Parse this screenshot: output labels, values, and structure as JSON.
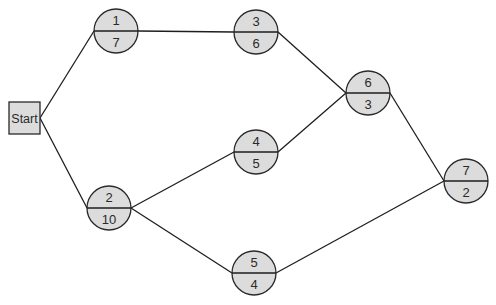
{
  "diagram": {
    "type": "network-diagram",
    "start": {
      "label": "Start",
      "x": 9,
      "y": 102,
      "w": 31,
      "h": 32
    },
    "nodes": [
      {
        "id": "1",
        "top": "1",
        "bottom": "7",
        "cx": 116,
        "cy": 31,
        "r": 22
      },
      {
        "id": "2",
        "top": "2",
        "bottom": "10",
        "cx": 109,
        "cy": 208,
        "r": 22
      },
      {
        "id": "3",
        "top": "3",
        "bottom": "6",
        "cx": 256,
        "cy": 32,
        "r": 22
      },
      {
        "id": "4",
        "top": "4",
        "bottom": "5",
        "cx": 256,
        "cy": 152,
        "r": 22
      },
      {
        "id": "5",
        "top": "5",
        "bottom": "4",
        "cx": 254,
        "cy": 273,
        "r": 22
      },
      {
        "id": "6",
        "top": "6",
        "bottom": "3",
        "cx": 368,
        "cy": 93,
        "r": 22
      },
      {
        "id": "7",
        "top": "7",
        "bottom": "2",
        "cx": 466,
        "cy": 181,
        "r": 22
      }
    ],
    "edges": [
      {
        "from": "Start",
        "to": "1"
      },
      {
        "from": "Start",
        "to": "2"
      },
      {
        "from": "1",
        "to": "3"
      },
      {
        "from": "2",
        "to": "4"
      },
      {
        "from": "2",
        "to": "5"
      },
      {
        "from": "3",
        "to": "6"
      },
      {
        "from": "4",
        "to": "6"
      },
      {
        "from": "6",
        "to": "7"
      },
      {
        "from": "5",
        "to": "7"
      }
    ],
    "colors": {
      "node_fill": "#dcdcdc",
      "stroke": "#1e1e1e",
      "text": "#2a2a2a"
    }
  }
}
